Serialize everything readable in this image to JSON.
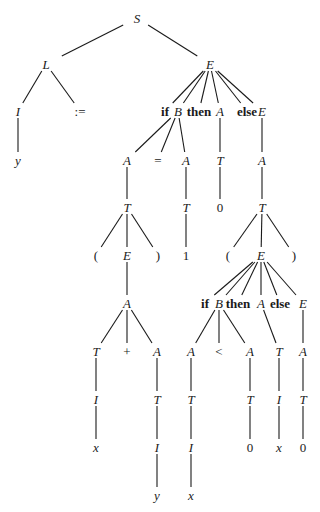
{
  "diagram": {
    "type": "parse-tree",
    "nodes": [
      {
        "id": "S",
        "label": "S",
        "kind": "nt",
        "x": 137,
        "y": 18
      },
      {
        "id": "L",
        "label": "L",
        "kind": "nt",
        "x": 46,
        "y": 64
      },
      {
        "id": "E1",
        "label": "E",
        "kind": "nt",
        "x": 210,
        "y": 64
      },
      {
        "id": "I1",
        "label": "I",
        "kind": "nt",
        "x": 18,
        "y": 111
      },
      {
        "id": "asg",
        "label": ":=",
        "kind": "tm",
        "x": 80,
        "y": 111
      },
      {
        "id": "y1",
        "label": "y",
        "kind": "nt",
        "x": 18,
        "y": 160
      },
      {
        "id": "if1",
        "label": "if",
        "kind": "kw",
        "x": 165,
        "y": 111
      },
      {
        "id": "B1",
        "label": "B",
        "kind": "nt",
        "x": 178,
        "y": 111
      },
      {
        "id": "then1",
        "label": "then",
        "kind": "kw",
        "x": 199,
        "y": 111
      },
      {
        "id": "A1",
        "label": "A",
        "kind": "nt",
        "x": 220,
        "y": 111
      },
      {
        "id": "else1",
        "label": "else",
        "kind": "kw",
        "x": 247,
        "y": 111
      },
      {
        "id": "E2",
        "label": "E",
        "kind": "nt",
        "x": 262,
        "y": 111
      },
      {
        "id": "A2",
        "label": "A",
        "kind": "nt",
        "x": 127,
        "y": 160
      },
      {
        "id": "eq",
        "label": "=",
        "kind": "tm",
        "x": 158,
        "y": 160
      },
      {
        "id": "A3",
        "label": "A",
        "kind": "nt",
        "x": 186,
        "y": 160
      },
      {
        "id": "T1",
        "label": "T",
        "kind": "nt",
        "x": 220,
        "y": 160
      },
      {
        "id": "A4",
        "label": "A",
        "kind": "nt",
        "x": 262,
        "y": 160
      },
      {
        "id": "T2",
        "label": "T",
        "kind": "nt",
        "x": 127,
        "y": 207
      },
      {
        "id": "T3",
        "label": "T",
        "kind": "nt",
        "x": 186,
        "y": 207
      },
      {
        "id": "zero1",
        "label": "0",
        "kind": "tm",
        "x": 220,
        "y": 207
      },
      {
        "id": "T4",
        "label": "T",
        "kind": "nt",
        "x": 262,
        "y": 207
      },
      {
        "id": "lp1",
        "label": "(",
        "kind": "tm",
        "x": 96,
        "y": 255
      },
      {
        "id": "E3",
        "label": "E",
        "kind": "nt",
        "x": 127,
        "y": 255
      },
      {
        "id": "rp1",
        "label": ")",
        "kind": "tm",
        "x": 158,
        "y": 255
      },
      {
        "id": "one",
        "label": "1",
        "kind": "tm",
        "x": 186,
        "y": 255
      },
      {
        "id": "lp2",
        "label": "(",
        "kind": "tm",
        "x": 228,
        "y": 255
      },
      {
        "id": "E4",
        "label": "E",
        "kind": "nt",
        "x": 261,
        "y": 255
      },
      {
        "id": "rp2",
        "label": ")",
        "kind": "tm",
        "x": 294,
        "y": 255
      },
      {
        "id": "A5",
        "label": "A",
        "kind": "nt",
        "x": 127,
        "y": 303
      },
      {
        "id": "if2",
        "label": "if",
        "kind": "kw",
        "x": 205,
        "y": 303
      },
      {
        "id": "B2",
        "label": "B",
        "kind": "nt",
        "x": 219,
        "y": 303
      },
      {
        "id": "then2",
        "label": "then",
        "kind": "kw",
        "x": 238,
        "y": 303
      },
      {
        "id": "A6",
        "label": "A",
        "kind": "nt",
        "x": 261,
        "y": 303
      },
      {
        "id": "else2",
        "label": "else",
        "kind": "kw",
        "x": 280,
        "y": 303
      },
      {
        "id": "E5",
        "label": "E",
        "kind": "nt",
        "x": 303,
        "y": 303
      },
      {
        "id": "T5",
        "label": "T",
        "kind": "nt",
        "x": 96,
        "y": 351
      },
      {
        "id": "plus",
        "label": "+",
        "kind": "tm",
        "x": 127,
        "y": 351
      },
      {
        "id": "A7",
        "label": "A",
        "kind": "nt",
        "x": 157,
        "y": 351
      },
      {
        "id": "A8",
        "label": "A",
        "kind": "nt",
        "x": 191,
        "y": 351
      },
      {
        "id": "lt",
        "label": "<",
        "kind": "tm",
        "x": 219,
        "y": 351
      },
      {
        "id": "A9",
        "label": "A",
        "kind": "nt",
        "x": 250,
        "y": 351
      },
      {
        "id": "T6",
        "label": "T",
        "kind": "nt",
        "x": 279,
        "y": 351
      },
      {
        "id": "A10",
        "label": "A",
        "kind": "nt",
        "x": 303,
        "y": 351
      },
      {
        "id": "I2",
        "label": "I",
        "kind": "nt",
        "x": 96,
        "y": 399
      },
      {
        "id": "T7",
        "label": "T",
        "kind": "nt",
        "x": 157,
        "y": 399
      },
      {
        "id": "T8",
        "label": "T",
        "kind": "nt",
        "x": 191,
        "y": 399
      },
      {
        "id": "T9",
        "label": "T",
        "kind": "nt",
        "x": 250,
        "y": 399
      },
      {
        "id": "I3",
        "label": "I",
        "kind": "nt",
        "x": 279,
        "y": 399
      },
      {
        "id": "T10",
        "label": "T",
        "kind": "nt",
        "x": 303,
        "y": 399
      },
      {
        "id": "x1",
        "label": "x",
        "kind": "nt",
        "x": 96,
        "y": 447
      },
      {
        "id": "I4",
        "label": "I",
        "kind": "nt",
        "x": 157,
        "y": 447
      },
      {
        "id": "I5",
        "label": "I",
        "kind": "nt",
        "x": 191,
        "y": 447
      },
      {
        "id": "zero2",
        "label": "0",
        "kind": "tm",
        "x": 250,
        "y": 447
      },
      {
        "id": "x2",
        "label": "x",
        "kind": "nt",
        "x": 279,
        "y": 447
      },
      {
        "id": "zero3",
        "label": "0",
        "kind": "tm",
        "x": 303,
        "y": 447
      },
      {
        "id": "y2",
        "label": "y",
        "kind": "nt",
        "x": 157,
        "y": 495
      },
      {
        "id": "x3",
        "label": "x",
        "kind": "nt",
        "x": 191,
        "y": 495
      }
    ],
    "edges": [
      [
        "S",
        "L"
      ],
      [
        "S",
        "E1"
      ],
      [
        "L",
        "I1"
      ],
      [
        "L",
        "asg"
      ],
      [
        "I1",
        "y1"
      ],
      [
        "E1",
        "if1"
      ],
      [
        "E1",
        "B1"
      ],
      [
        "E1",
        "then1"
      ],
      [
        "E1",
        "A1"
      ],
      [
        "E1",
        "else1"
      ],
      [
        "E1",
        "E2"
      ],
      [
        "B1",
        "A2"
      ],
      [
        "B1",
        "eq"
      ],
      [
        "B1",
        "A3"
      ],
      [
        "A1",
        "T1"
      ],
      [
        "E2",
        "A4"
      ],
      [
        "A2",
        "T2"
      ],
      [
        "A3",
        "T3"
      ],
      [
        "T1",
        "zero1"
      ],
      [
        "A4",
        "T4"
      ],
      [
        "T2",
        "lp1"
      ],
      [
        "T2",
        "E3"
      ],
      [
        "T2",
        "rp1"
      ],
      [
        "T3",
        "one"
      ],
      [
        "T4",
        "lp2"
      ],
      [
        "T4",
        "E4"
      ],
      [
        "T4",
        "rp2"
      ],
      [
        "E3",
        "A5"
      ],
      [
        "E4",
        "if2"
      ],
      [
        "E4",
        "B2"
      ],
      [
        "E4",
        "then2"
      ],
      [
        "E4",
        "A6"
      ],
      [
        "E4",
        "else2"
      ],
      [
        "E4",
        "E5"
      ],
      [
        "A5",
        "T5"
      ],
      [
        "A5",
        "plus"
      ],
      [
        "A5",
        "A7"
      ],
      [
        "B2",
        "A8"
      ],
      [
        "B2",
        "lt"
      ],
      [
        "B2",
        "A9"
      ],
      [
        "A6",
        "T6"
      ],
      [
        "E5",
        "A10"
      ],
      [
        "T5",
        "I2"
      ],
      [
        "A7",
        "T7"
      ],
      [
        "A8",
        "T8"
      ],
      [
        "A9",
        "T9"
      ],
      [
        "T6",
        "I3"
      ],
      [
        "A10",
        "T10"
      ],
      [
        "I2",
        "x1"
      ],
      [
        "T7",
        "I4"
      ],
      [
        "T8",
        "I5"
      ],
      [
        "T9",
        "zero2"
      ],
      [
        "I3",
        "x2"
      ],
      [
        "T10",
        "zero3"
      ],
      [
        "I4",
        "y2"
      ],
      [
        "I5",
        "x3"
      ]
    ]
  }
}
